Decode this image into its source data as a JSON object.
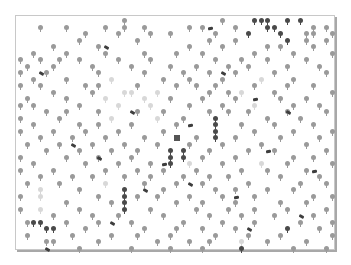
{
  "game": {
    "board": {
      "left": 15,
      "top": 15,
      "width": 320,
      "height": 235,
      "cell": 6.5,
      "origin_x": 17,
      "origin_y": 17
    },
    "colors": {
      "light": "#9a9a9a",
      "faint": "#d8d8d8",
      "dark": "#4a4a4a",
      "log": "#3e3e3e",
      "player": "#555555"
    },
    "player": {
      "col": 24,
      "row": 18
    },
    "trees": [
      [
        16,
        0,
        "l"
      ],
      [
        31,
        0,
        "l"
      ],
      [
        36,
        0,
        "d"
      ],
      [
        37,
        0,
        "d"
      ],
      [
        38,
        0,
        "d"
      ],
      [
        41,
        0,
        "d"
      ],
      [
        43,
        0,
        "d"
      ],
      [
        3,
        1,
        "l"
      ],
      [
        7,
        1,
        "l"
      ],
      [
        13,
        1,
        "l"
      ],
      [
        16,
        1,
        "l"
      ],
      [
        19,
        1,
        "l"
      ],
      [
        26,
        1,
        "l"
      ],
      [
        28,
        1,
        "l"
      ],
      [
        33,
        1,
        "l"
      ],
      [
        38,
        1,
        "d"
      ],
      [
        39,
        1,
        "d"
      ],
      [
        45,
        1,
        "l"
      ],
      [
        47,
        1,
        "l"
      ],
      [
        10,
        2,
        "l"
      ],
      [
        15,
        2,
        "l"
      ],
      [
        20,
        2,
        "l"
      ],
      [
        23,
        2,
        "l"
      ],
      [
        30,
        2,
        "l"
      ],
      [
        35,
        2,
        "d"
      ],
      [
        40,
        2,
        "d"
      ],
      [
        44,
        2,
        "l"
      ],
      [
        45,
        2,
        "l"
      ],
      [
        48,
        2,
        "l"
      ],
      [
        9,
        3,
        "l"
      ],
      [
        18,
        3,
        "l"
      ],
      [
        29,
        3,
        "l"
      ],
      [
        33,
        3,
        "l"
      ],
      [
        41,
        3,
        "d"
      ],
      [
        44,
        3,
        "l"
      ],
      [
        47,
        3,
        "l"
      ],
      [
        5,
        4,
        "l"
      ],
      [
        12,
        4,
        "l"
      ],
      [
        26,
        4,
        "l"
      ],
      [
        31,
        4,
        "l"
      ],
      [
        38,
        4,
        "l"
      ],
      [
        40,
        4,
        "l"
      ],
      [
        45,
        4,
        "l"
      ],
      [
        2,
        5,
        "l"
      ],
      [
        7,
        5,
        "l"
      ],
      [
        13,
        5,
        "l"
      ],
      [
        19,
        5,
        "l"
      ],
      [
        24,
        5,
        "l"
      ],
      [
        28,
        5,
        "l"
      ],
      [
        36,
        5,
        "l"
      ],
      [
        42,
        5,
        "l"
      ],
      [
        48,
        5,
        "l"
      ],
      [
        0,
        6,
        "l"
      ],
      [
        3,
        6,
        "l"
      ],
      [
        6,
        6,
        "l"
      ],
      [
        9,
        6,
        "l"
      ],
      [
        15,
        6,
        "l"
      ],
      [
        20,
        6,
        "l"
      ],
      [
        30,
        6,
        "l"
      ],
      [
        34,
        6,
        "l"
      ],
      [
        38,
        6,
        "l"
      ],
      [
        44,
        6,
        "l"
      ],
      [
        1,
        7,
        "l"
      ],
      [
        5,
        7,
        "l"
      ],
      [
        11,
        7,
        "l"
      ],
      [
        17,
        7,
        "l"
      ],
      [
        23,
        7,
        "l"
      ],
      [
        27,
        7,
        "l"
      ],
      [
        32,
        7,
        "l"
      ],
      [
        35,
        7,
        "l"
      ],
      [
        41,
        7,
        "l"
      ],
      [
        46,
        7,
        "l"
      ],
      [
        0,
        8,
        "l"
      ],
      [
        4,
        8,
        "l"
      ],
      [
        12,
        8,
        "l"
      ],
      [
        19,
        8,
        "l"
      ],
      [
        25,
        8,
        "l"
      ],
      [
        29,
        8,
        "l"
      ],
      [
        33,
        8,
        "l"
      ],
      [
        39,
        8,
        "l"
      ],
      [
        47,
        8,
        "l"
      ],
      [
        2,
        9,
        "l"
      ],
      [
        7,
        9,
        "l"
      ],
      [
        14,
        9,
        "f"
      ],
      [
        22,
        9,
        "l"
      ],
      [
        26,
        9,
        "l"
      ],
      [
        31,
        9,
        "l"
      ],
      [
        37,
        9,
        "f"
      ],
      [
        42,
        9,
        "l"
      ],
      [
        0,
        10,
        "l"
      ],
      [
        3,
        10,
        "l"
      ],
      [
        10,
        10,
        "l"
      ],
      [
        12,
        10,
        "l"
      ],
      [
        18,
        10,
        "l"
      ],
      [
        24,
        10,
        "l"
      ],
      [
        27,
        10,
        "l"
      ],
      [
        30,
        10,
        "l"
      ],
      [
        36,
        10,
        "l"
      ],
      [
        41,
        10,
        "l"
      ],
      [
        45,
        10,
        "l"
      ],
      [
        5,
        11,
        "l"
      ],
      [
        11,
        11,
        "l"
      ],
      [
        16,
        11,
        "f"
      ],
      [
        17,
        11,
        "f"
      ],
      [
        21,
        11,
        "f"
      ],
      [
        29,
        11,
        "l"
      ],
      [
        32,
        11,
        "l"
      ],
      [
        34,
        11,
        "f"
      ],
      [
        39,
        11,
        "l"
      ],
      [
        48,
        11,
        "l"
      ],
      [
        1,
        12,
        "l"
      ],
      [
        7,
        12,
        "l"
      ],
      [
        13,
        12,
        "f"
      ],
      [
        19,
        12,
        "f"
      ],
      [
        23,
        12,
        "l"
      ],
      [
        28,
        12,
        "l"
      ],
      [
        33,
        12,
        "l"
      ],
      [
        40,
        12,
        "l"
      ],
      [
        44,
        12,
        "l"
      ],
      [
        0,
        13,
        "l"
      ],
      [
        2,
        13,
        "l"
      ],
      [
        9,
        13,
        "l"
      ],
      [
        15,
        13,
        "f"
      ],
      [
        20,
        13,
        "f"
      ],
      [
        26,
        13,
        "l"
      ],
      [
        31,
        13,
        "l"
      ],
      [
        36,
        13,
        "f"
      ],
      [
        42,
        13,
        "l"
      ],
      [
        46,
        13,
        "l"
      ],
      [
        4,
        14,
        "l"
      ],
      [
        7,
        14,
        "l"
      ],
      [
        12,
        14,
        "l"
      ],
      [
        18,
        14,
        "l"
      ],
      [
        22,
        14,
        "l"
      ],
      [
        29,
        14,
        "l"
      ],
      [
        32,
        14,
        "l"
      ],
      [
        35,
        14,
        "l"
      ],
      [
        41,
        14,
        "l"
      ],
      [
        47,
        14,
        "l"
      ],
      [
        0,
        15,
        "l"
      ],
      [
        6,
        15,
        "l"
      ],
      [
        14,
        15,
        "f"
      ],
      [
        21,
        15,
        "f"
      ],
      [
        25,
        15,
        "l"
      ],
      [
        30,
        15,
        "d"
      ],
      [
        38,
        15,
        "l"
      ],
      [
        43,
        15,
        "l"
      ],
      [
        2,
        16,
        "l"
      ],
      [
        9,
        16,
        "l"
      ],
      [
        12,
        16,
        "l"
      ],
      [
        17,
        16,
        "l"
      ],
      [
        24,
        16,
        "l"
      ],
      [
        30,
        16,
        "d"
      ],
      [
        34,
        16,
        "l"
      ],
      [
        39,
        16,
        "l"
      ],
      [
        45,
        16,
        "l"
      ],
      [
        0,
        17,
        "l"
      ],
      [
        5,
        17,
        "l"
      ],
      [
        10,
        17,
        "l"
      ],
      [
        15,
        17,
        "l"
      ],
      [
        22,
        17,
        "l"
      ],
      [
        30,
        17,
        "d"
      ],
      [
        36,
        17,
        "l"
      ],
      [
        42,
        17,
        "l"
      ],
      [
        48,
        17,
        "l"
      ],
      [
        3,
        18,
        "l"
      ],
      [
        8,
        18,
        "l"
      ],
      [
        13,
        18,
        "l"
      ],
      [
        19,
        18,
        "l"
      ],
      [
        27,
        18,
        "l"
      ],
      [
        30,
        18,
        "d"
      ],
      [
        33,
        18,
        "l"
      ],
      [
        40,
        18,
        "l"
      ],
      [
        46,
        18,
        "l"
      ],
      [
        1,
        19,
        "l"
      ],
      [
        6,
        19,
        "l"
      ],
      [
        11,
        19,
        "l"
      ],
      [
        16,
        19,
        "l"
      ],
      [
        21,
        19,
        "l"
      ],
      [
        26,
        19,
        "l"
      ],
      [
        31,
        19,
        "l"
      ],
      [
        37,
        19,
        "l"
      ],
      [
        44,
        19,
        "l"
      ],
      [
        4,
        20,
        "l"
      ],
      [
        9,
        20,
        "l"
      ],
      [
        14,
        20,
        "l"
      ],
      [
        18,
        20,
        "l"
      ],
      [
        23,
        20,
        "d"
      ],
      [
        25,
        20,
        "d"
      ],
      [
        29,
        20,
        "l"
      ],
      [
        35,
        20,
        "l"
      ],
      [
        39,
        20,
        "l"
      ],
      [
        47,
        20,
        "l"
      ],
      [
        0,
        21,
        "l"
      ],
      [
        7,
        21,
        "l"
      ],
      [
        12,
        21,
        "l"
      ],
      [
        17,
        21,
        "l"
      ],
      [
        23,
        21,
        "d"
      ],
      [
        25,
        21,
        "d"
      ],
      [
        28,
        21,
        "l"
      ],
      [
        33,
        21,
        "l"
      ],
      [
        42,
        21,
        "l"
      ],
      [
        45,
        21,
        "l"
      ],
      [
        2,
        22,
        "l"
      ],
      [
        10,
        22,
        "l"
      ],
      [
        15,
        22,
        "l"
      ],
      [
        20,
        22,
        "l"
      ],
      [
        23,
        22,
        "d"
      ],
      [
        26,
        22,
        "f"
      ],
      [
        31,
        22,
        "l"
      ],
      [
        37,
        22,
        "f"
      ],
      [
        41,
        22,
        "l"
      ],
      [
        48,
        22,
        "l"
      ],
      [
        0,
        23,
        "l"
      ],
      [
        5,
        23,
        "l"
      ],
      [
        13,
        23,
        "l"
      ],
      [
        18,
        23,
        "l"
      ],
      [
        22,
        23,
        "l"
      ],
      [
        27,
        23,
        "l"
      ],
      [
        34,
        23,
        "l"
      ],
      [
        38,
        23,
        "l"
      ],
      [
        44,
        23,
        "l"
      ],
      [
        3,
        24,
        "l"
      ],
      [
        8,
        24,
        "l"
      ],
      [
        11,
        24,
        "l"
      ],
      [
        16,
        24,
        "l"
      ],
      [
        20,
        24,
        "l"
      ],
      [
        25,
        24,
        "l"
      ],
      [
        29,
        24,
        "l"
      ],
      [
        32,
        24,
        "l"
      ],
      [
        40,
        24,
        "l"
      ],
      [
        46,
        24,
        "l"
      ],
      [
        1,
        25,
        "l"
      ],
      [
        6,
        25,
        "l"
      ],
      [
        13,
        25,
        "f"
      ],
      [
        19,
        25,
        "l"
      ],
      [
        24,
        25,
        "l"
      ],
      [
        28,
        25,
        "l"
      ],
      [
        35,
        25,
        "l"
      ],
      [
        43,
        25,
        "l"
      ],
      [
        47,
        25,
        "l"
      ],
      [
        3,
        26,
        "f"
      ],
      [
        9,
        26,
        "l"
      ],
      [
        16,
        26,
        "d"
      ],
      [
        22,
        26,
        "l"
      ],
      [
        30,
        26,
        "l"
      ],
      [
        33,
        26,
        "l"
      ],
      [
        38,
        26,
        "l"
      ],
      [
        42,
        26,
        "l"
      ],
      [
        0,
        27,
        "l"
      ],
      [
        3,
        27,
        "f"
      ],
      [
        12,
        27,
        "l"
      ],
      [
        16,
        27,
        "d"
      ],
      [
        18,
        27,
        "l"
      ],
      [
        21,
        27,
        "l"
      ],
      [
        26,
        27,
        "l"
      ],
      [
        31,
        27,
        "l"
      ],
      [
        36,
        27,
        "l"
      ],
      [
        45,
        27,
        "l"
      ],
      [
        48,
        27,
        "l"
      ],
      [
        7,
        28,
        "l"
      ],
      [
        14,
        28,
        "l"
      ],
      [
        16,
        28,
        "d"
      ],
      [
        24,
        28,
        "l"
      ],
      [
        28,
        28,
        "l"
      ],
      [
        33,
        28,
        "l"
      ],
      [
        40,
        28,
        "l"
      ],
      [
        44,
        28,
        "l"
      ],
      [
        0,
        29,
        "l"
      ],
      [
        3,
        29,
        "f"
      ],
      [
        9,
        29,
        "l"
      ],
      [
        16,
        29,
        "d"
      ],
      [
        20,
        29,
        "l"
      ],
      [
        27,
        29,
        "l"
      ],
      [
        32,
        29,
        "l"
      ],
      [
        36,
        29,
        "l"
      ],
      [
        41,
        29,
        "l"
      ],
      [
        47,
        29,
        "l"
      ],
      [
        5,
        30,
        "l"
      ],
      [
        11,
        30,
        "l"
      ],
      [
        15,
        30,
        "l"
      ],
      [
        22,
        30,
        "l"
      ],
      [
        29,
        30,
        "l"
      ],
      [
        34,
        30,
        "l"
      ],
      [
        39,
        30,
        "l"
      ],
      [
        45,
        30,
        "l"
      ],
      [
        1,
        31,
        "l"
      ],
      [
        2,
        31,
        "d"
      ],
      [
        3,
        31,
        "d"
      ],
      [
        7,
        31,
        "l"
      ],
      [
        12,
        31,
        "l"
      ],
      [
        17,
        31,
        "l"
      ],
      [
        25,
        31,
        "l"
      ],
      [
        31,
        31,
        "l"
      ],
      [
        36,
        31,
        "l"
      ],
      [
        43,
        31,
        "l"
      ],
      [
        48,
        31,
        "l"
      ],
      [
        4,
        32,
        "d"
      ],
      [
        5,
        32,
        "d"
      ],
      [
        10,
        32,
        "l"
      ],
      [
        19,
        32,
        "l"
      ],
      [
        24,
        32,
        "l"
      ],
      [
        28,
        32,
        "l"
      ],
      [
        33,
        32,
        "l"
      ],
      [
        41,
        32,
        "d"
      ],
      [
        46,
        32,
        "l"
      ],
      [
        1,
        33,
        "l"
      ],
      [
        8,
        33,
        "l"
      ],
      [
        14,
        33,
        "l"
      ],
      [
        18,
        33,
        "l"
      ],
      [
        23,
        33,
        "l"
      ],
      [
        30,
        33,
        "l"
      ],
      [
        35,
        33,
        "l"
      ],
      [
        40,
        33,
        "l"
      ],
      [
        48,
        33,
        "l"
      ],
      [
        4,
        34,
        "l"
      ],
      [
        5,
        34,
        "l"
      ],
      [
        12,
        34,
        "l"
      ],
      [
        21,
        34,
        "l"
      ],
      [
        26,
        34,
        "l"
      ],
      [
        29,
        34,
        "l"
      ],
      [
        34,
        34,
        "f"
      ],
      [
        38,
        34,
        "l"
      ],
      [
        44,
        34,
        "l"
      ],
      [
        9,
        35,
        "l"
      ],
      [
        17,
        35,
        "l"
      ],
      [
        23,
        35,
        "l"
      ],
      [
        28,
        35,
        "l"
      ],
      [
        34,
        35,
        "d"
      ],
      [
        42,
        35,
        "l"
      ],
      [
        47,
        35,
        "l"
      ]
    ],
    "logs": [
      [
        29,
        1
      ],
      [
        3,
        8
      ],
      [
        13,
        4
      ],
      [
        36,
        12
      ],
      [
        17,
        14
      ],
      [
        12,
        21
      ],
      [
        26,
        25
      ],
      [
        22,
        22
      ],
      [
        38,
        20
      ],
      [
        45,
        23
      ],
      [
        33,
        27
      ],
      [
        26,
        16
      ],
      [
        43,
        30
      ],
      [
        8,
        19
      ],
      [
        19,
        26
      ],
      [
        14,
        31
      ],
      [
        4,
        35
      ],
      [
        35,
        32
      ],
      [
        41,
        14
      ],
      [
        31,
        8
      ]
    ]
  }
}
